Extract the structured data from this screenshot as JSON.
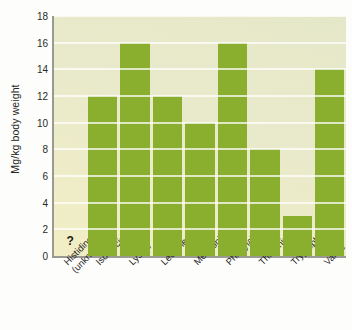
{
  "chart_data": {
    "type": "bar",
    "title": "",
    "xlabel": "",
    "ylabel": "Mg/kg body weight",
    "ylim": [
      0,
      18
    ],
    "ytick_step": 2,
    "yticks": [
      18,
      16,
      14,
      12,
      10,
      8,
      6,
      4,
      2,
      0
    ],
    "grid": true,
    "legend": "none",
    "categories": [
      "Histidine (unknown)",
      "Isoleucine",
      "Lysine",
      "Leucine",
      "Methionine",
      "Phenylalanine",
      "Threonine",
      "Tryptophan",
      "Valine"
    ],
    "category_lines": [
      [
        "Histidine",
        "(unknown)"
      ],
      [
        "Isoleucine",
        ""
      ],
      [
        "Lysine",
        ""
      ],
      [
        "Leucine",
        ""
      ],
      [
        "Methionine",
        ""
      ],
      [
        "Phenylalanine",
        ""
      ],
      [
        "Threonine",
        ""
      ],
      [
        "Tryptophan",
        ""
      ],
      [
        "Valine",
        ""
      ]
    ],
    "values": [
      null,
      12,
      16,
      12,
      10,
      16,
      8,
      3,
      14
    ],
    "annotations": [
      {
        "category": "Histidine (unknown)",
        "text": "?"
      }
    ],
    "colors": {
      "bar": "#8aae2e",
      "plot_background_top": "#e5e8c8",
      "plot_background_bottom": "#f1eec4",
      "gridline": "#ffffff",
      "axis": "#9a9a93",
      "text": "#26261f",
      "page_background": "#ffffff"
    }
  }
}
